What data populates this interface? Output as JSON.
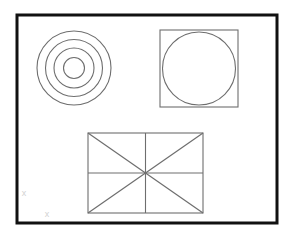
{
  "document": {
    "title": "Geometric Construction Drawing",
    "background_color": "#ffffff",
    "width": 297,
    "height": 239
  },
  "frame": {
    "name": "drawing-border",
    "x": 17,
    "y": 15,
    "width": 260,
    "height": 208,
    "stroke_color": "#111111",
    "stroke_width": 3,
    "fill": "none"
  },
  "figures": {
    "concentric_circles": {
      "label": "concentric-circles",
      "center_x": 74,
      "center_y": 68,
      "stroke_color": "#6e6e6e",
      "stroke_width": 1.1,
      "fill": "none",
      "count": 4,
      "radii": [
        10.5,
        20,
        28.5,
        37
      ]
    },
    "circle_in_square": {
      "label": "circle-inscribed-in-square",
      "square": {
        "x": 160,
        "y": 30,
        "width": 78,
        "height": 77,
        "stroke_color": "#6e6e6e",
        "stroke_width": 1.1,
        "fill": "none"
      },
      "circle": {
        "center_x": 199,
        "center_y": 68.5,
        "radius": 36.5,
        "stroke_color": "#6e6e6e",
        "stroke_width": 1.1,
        "fill": "none"
      }
    },
    "rectangle_with_diagonals": {
      "label": "rectangle-with-diagonals-and-medians",
      "x": 88,
      "y": 133,
      "width": 115,
      "height": 80,
      "stroke_color": "#6e6e6e",
      "stroke_width": 1.1,
      "fill": "none",
      "center_x": 145.5,
      "center_y": 173,
      "internal_lines": [
        {
          "name": "diagonal-tl-br",
          "x1": 88,
          "y1": 133,
          "x2": 203,
          "y2": 213
        },
        {
          "name": "diagonal-bl-tr",
          "x1": 88,
          "y1": 213,
          "x2": 203,
          "y2": 133
        },
        {
          "name": "vertical-median",
          "x1": 145.5,
          "y1": 133,
          "x2": 145.5,
          "y2": 213
        },
        {
          "name": "horizontal-median",
          "x1": 88,
          "y1": 173,
          "x2": 203,
          "y2": 173
        }
      ]
    }
  },
  "markers": [
    {
      "name": "corner-mark-upper",
      "glyph": "x",
      "x": 24,
      "y": 196,
      "size": 9,
      "color": "#d2d2d2"
    },
    {
      "name": "corner-mark-lower",
      "glyph": "x",
      "x": 47,
      "y": 217,
      "size": 9,
      "color": "#d2d2d2"
    }
  ]
}
